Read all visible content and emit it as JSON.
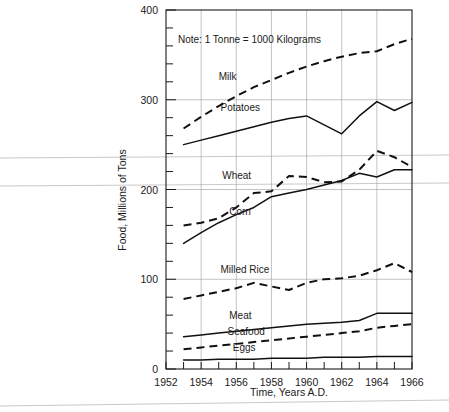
{
  "chart_data": {
    "type": "line",
    "title": "",
    "xlabel": "Time, Years A.D.",
    "ylabel": "Food, Millions of Tons",
    "xlim": [
      1952,
      1966
    ],
    "ylim": [
      0,
      400
    ],
    "grid": true,
    "legend_position": "inline-labels",
    "annotations": [
      "Note:  1 Tonne = 1000 Kilograms"
    ],
    "x_tick_labels": [
      "1952",
      "1954",
      "1956",
      "1958",
      "1960",
      "1962",
      "1964",
      "1966"
    ],
    "x_tick_values": [
      1952,
      1954,
      1956,
      1958,
      1960,
      1962,
      1964,
      1966
    ],
    "x_minor_tick_step": 1,
    "y_tick_labels": [
      "0",
      "100",
      "200",
      "300",
      "400"
    ],
    "y_tick_values": [
      0,
      100,
      200,
      300,
      400
    ],
    "y_minor_tick_step": 20,
    "x": [
      1953,
      1954,
      1955,
      1956,
      1957,
      1958,
      1959,
      1960,
      1961,
      1962,
      1963,
      1964,
      1965,
      1966
    ],
    "series": [
      {
        "name": "Milk",
        "style": "dashed",
        "values": [
          268,
          281,
          293,
          304,
          314,
          322,
          330,
          337,
          343,
          348,
          352,
          354,
          362,
          368
        ]
      },
      {
        "name": "Potatoes",
        "style": "solid",
        "values": [
          250,
          255,
          260,
          265,
          270,
          275,
          279,
          282,
          272,
          262,
          282,
          298,
          288,
          297
        ]
      },
      {
        "name": "Wheat",
        "style": "dashed",
        "values": [
          160,
          163,
          168,
          180,
          196,
          198,
          215,
          214,
          208,
          209,
          222,
          243,
          236,
          225
        ]
      },
      {
        "name": "Corn",
        "style": "solid",
        "values": [
          140,
          152,
          163,
          172,
          180,
          192,
          196,
          200,
          205,
          210,
          218,
          214,
          222,
          222
        ]
      },
      {
        "name": "Milled Rice",
        "style": "dashed",
        "values": [
          78,
          82,
          86,
          90,
          96,
          92,
          88,
          96,
          100,
          101,
          104,
          110,
          118,
          108
        ]
      },
      {
        "name": "Meat",
        "style": "solid",
        "values": [
          36,
          38,
          40,
          42,
          44,
          46,
          48,
          50,
          51,
          52,
          54,
          62,
          62,
          62
        ]
      },
      {
        "name": "Seafood",
        "style": "dashed",
        "values": [
          22,
          24,
          26,
          28,
          30,
          32,
          34,
          36,
          38,
          40,
          42,
          46,
          48,
          50
        ]
      },
      {
        "name": "Eggs",
        "style": "solid",
        "values": [
          10,
          10,
          11,
          11,
          11,
          12,
          12,
          12,
          13,
          13,
          13,
          14,
          14,
          14
        ]
      }
    ],
    "series_label_positions": [
      {
        "name": "Milk",
        "x": 1955.0,
        "y": 322
      },
      {
        "name": "Potatoes",
        "x": 1955.1,
        "y": 288
      },
      {
        "name": "Wheat",
        "x": 1955.2,
        "y": 212
      },
      {
        "name": "Corn",
        "x": 1955.6,
        "y": 172
      },
      {
        "name": "Milled Rice",
        "x": 1955.1,
        "y": 107
      },
      {
        "name": "Meat",
        "x": 1955.6,
        "y": 56
      },
      {
        "name": "Seafood",
        "x": 1955.5,
        "y": 38
      },
      {
        "name": "Eggs",
        "x": 1955.8,
        "y": 20
      }
    ]
  }
}
